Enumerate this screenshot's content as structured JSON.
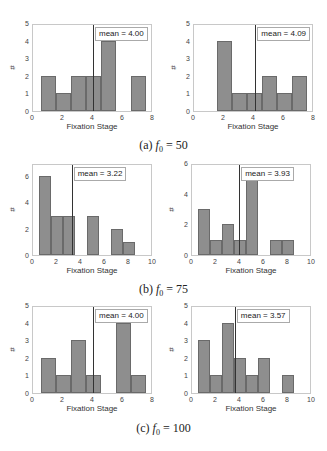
{
  "captions": {
    "a": {
      "label": "(a)",
      "var": "f",
      "sub": "0",
      "eq": " = 50"
    },
    "b": {
      "label": "(b)",
      "var": "f",
      "sub": "0",
      "eq": " = 75"
    },
    "c": {
      "label": "(c)",
      "var": "f",
      "sub": "0",
      "eq": " = 100"
    }
  },
  "chart_data": [
    {
      "type": "bar",
      "panel": "a-left",
      "title": "",
      "xlabel": "Fixation Stage",
      "ylabel": "#",
      "xlim": [
        0,
        8
      ],
      "ylim": [
        0,
        5
      ],
      "xticks": [
        0,
        2,
        4,
        6,
        8
      ],
      "yticks": [
        0,
        1,
        2,
        3,
        4,
        5
      ],
      "categories": [
        1,
        2,
        3,
        4,
        5,
        6,
        7
      ],
      "values": [
        2,
        1,
        2,
        2,
        4,
        0,
        2
      ],
      "mean": 4.0,
      "legend": "mean = 4.00"
    },
    {
      "type": "bar",
      "panel": "a-right",
      "title": "",
      "xlabel": "Fixation Stage",
      "ylabel": "#",
      "xlim": [
        0,
        8
      ],
      "ylim": [
        0,
        5
      ],
      "xticks": [
        0,
        2,
        4,
        6,
        8
      ],
      "yticks": [
        0,
        1,
        2,
        3,
        4,
        5
      ],
      "categories": [
        1,
        2,
        3,
        4,
        5,
        6,
        7
      ],
      "values": [
        0,
        4,
        1,
        1,
        2,
        1,
        2
      ],
      "mean": 4.09,
      "legend": "mean = 4.09"
    },
    {
      "type": "bar",
      "panel": "b-left",
      "title": "",
      "xlabel": "Fixation Stage",
      "ylabel": "#",
      "xlim": [
        0,
        10
      ],
      "ylim": [
        0,
        7
      ],
      "xticks": [
        0,
        2,
        4,
        6,
        8,
        10
      ],
      "yticks": [
        0,
        2,
        4,
        6
      ],
      "categories": [
        1,
        2,
        3,
        4,
        5,
        6,
        7,
        8
      ],
      "values": [
        6,
        3,
        3,
        0,
        3,
        0,
        2,
        1
      ],
      "mean": 3.22,
      "legend": "mean = 3.22"
    },
    {
      "type": "bar",
      "panel": "b-right",
      "title": "",
      "xlabel": "Fixation Stage",
      "ylabel": "#",
      "xlim": [
        0,
        10
      ],
      "ylim": [
        0,
        6
      ],
      "xticks": [
        0,
        2,
        4,
        6,
        8,
        10
      ],
      "yticks": [
        0,
        2,
        4,
        6
      ],
      "categories": [
        1,
        2,
        3,
        4,
        5,
        6,
        7,
        8
      ],
      "values": [
        3,
        1,
        2,
        1,
        5,
        0,
        1,
        1
      ],
      "mean": 3.93,
      "legend": "mean = 3.93"
    },
    {
      "type": "bar",
      "panel": "c-left",
      "title": "",
      "xlabel": "Fixation Stage",
      "ylabel": "#",
      "xlim": [
        0,
        8
      ],
      "ylim": [
        0,
        5
      ],
      "xticks": [
        0,
        2,
        4,
        6,
        8
      ],
      "yticks": [
        0,
        1,
        2,
        3,
        4,
        5
      ],
      "categories": [
        1,
        2,
        3,
        4,
        5,
        6,
        7
      ],
      "values": [
        2,
        1,
        3,
        1,
        0,
        4,
        1
      ],
      "mean": 4.0,
      "legend": "mean = 4.00"
    },
    {
      "type": "bar",
      "panel": "c-right",
      "title": "",
      "xlabel": "Fixation Stage",
      "ylabel": "#",
      "xlim": [
        0,
        10
      ],
      "ylim": [
        0,
        5
      ],
      "xticks": [
        0,
        2,
        4,
        6,
        8,
        10
      ],
      "yticks": [
        0,
        1,
        2,
        3,
        4,
        5
      ],
      "categories": [
        1,
        2,
        3,
        4,
        5,
        6,
        7,
        8
      ],
      "values": [
        3,
        1,
        4,
        2,
        1,
        2,
        0,
        1
      ],
      "mean": 3.57,
      "legend": "mean = 3.57"
    }
  ],
  "layout": [
    {
      "left": 32,
      "top": 24,
      "width": 120,
      "height": 88
    },
    {
      "left": 193,
      "top": 24,
      "width": 120,
      "height": 88
    },
    {
      "left": 32,
      "top": 164,
      "width": 120,
      "height": 92
    },
    {
      "left": 191,
      "top": 164,
      "width": 120,
      "height": 92
    },
    {
      "left": 32,
      "top": 306,
      "width": 120,
      "height": 88
    },
    {
      "left": 191,
      "top": 306,
      "width": 120,
      "height": 88
    }
  ]
}
